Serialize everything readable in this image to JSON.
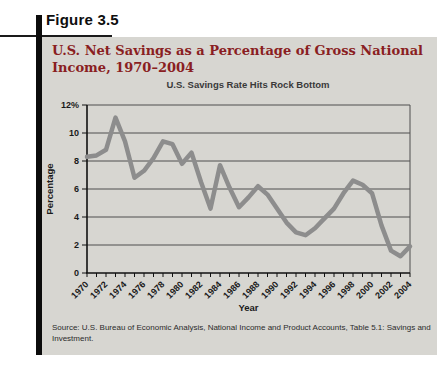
{
  "figure": {
    "label": "Figure 3.5",
    "title": "U.S. Net Savings as a Percentage of Gross National Income, 1970–2004",
    "source_line1": "Source: U.S. Bureau of Economic Analysis, National Income and Product Accounts, Table 5.1: Savings and",
    "source_line2": "Investment."
  },
  "chart_data": {
    "type": "line",
    "title": "U.S. Savings Rate Hits Rock Bottom",
    "xlabel": "Year",
    "ylabel": "Percentage",
    "x": [
      1970,
      1971,
      1972,
      1973,
      1974,
      1975,
      1976,
      1977,
      1978,
      1979,
      1980,
      1981,
      1982,
      1983,
      1984,
      1985,
      1986,
      1987,
      1988,
      1989,
      1990,
      1991,
      1992,
      1993,
      1994,
      1995,
      1996,
      1997,
      1998,
      1999,
      2000,
      2001,
      2002,
      2003,
      2004
    ],
    "values": [
      8.3,
      8.4,
      8.8,
      11.1,
      9.4,
      6.8,
      7.3,
      8.2,
      9.4,
      9.2,
      7.8,
      8.6,
      6.5,
      4.6,
      7.7,
      6.1,
      4.7,
      5.4,
      6.2,
      5.6,
      4.6,
      3.6,
      2.9,
      2.7,
      3.2,
      3.9,
      4.6,
      5.7,
      6.6,
      6.3,
      5.7,
      3.4,
      1.6,
      1.2,
      1.9
    ],
    "ylim": [
      0,
      12
    ],
    "yticks": [
      {
        "v": 0,
        "label": "0"
      },
      {
        "v": 2,
        "label": "2"
      },
      {
        "v": 4,
        "label": "4"
      },
      {
        "v": 6,
        "label": "6"
      },
      {
        "v": 8,
        "label": "8"
      },
      {
        "v": 10,
        "label": "10"
      },
      {
        "v": 12,
        "label": "12%"
      }
    ],
    "xtick_label_step": 2,
    "grid": true,
    "legend": "none",
    "line_color": "#8d8d8d",
    "grid_color": "#4f4f4f",
    "axis_color": "#111111"
  },
  "colors": {
    "panel_bg": "#d7d6d1",
    "title_red": "#8a1e22",
    "sidebar_black": "#0c0c0c",
    "page_bg": "#ffffff"
  }
}
